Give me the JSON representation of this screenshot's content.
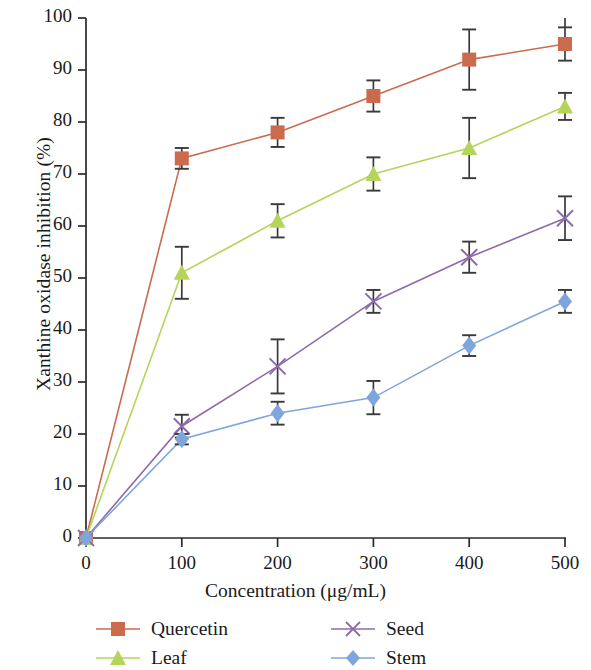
{
  "chart_data": {
    "type": "line",
    "title": "",
    "xlabel": "Concentration (μg/mL)",
    "ylabel": "Xanthine oxidase inhibition (%)",
    "x": [
      0,
      100,
      200,
      300,
      400,
      500
    ],
    "xlim": [
      0,
      500
    ],
    "ylim": [
      0,
      100
    ],
    "xticks": [
      "0",
      "100",
      "200",
      "300",
      "400",
      "500"
    ],
    "yticks": [
      "0",
      "10",
      "20",
      "30",
      "40",
      "50",
      "60",
      "70",
      "80",
      "90",
      "100"
    ],
    "grid": false,
    "legend_position": "below",
    "errorbars": true,
    "series": [
      {
        "name": "Quercetin",
        "color": "#cc6a4e",
        "marker": "square",
        "values": [
          0,
          73,
          78,
          85,
          92,
          95
        ],
        "errors": [
          0,
          2.0,
          2.8,
          3.0,
          5.8,
          3.2
        ]
      },
      {
        "name": "Leaf",
        "color": "#b4d45a",
        "marker": "triangle",
        "values": [
          0,
          51,
          61,
          70,
          75,
          83
        ],
        "errors": [
          0,
          5.0,
          3.2,
          3.2,
          5.8,
          2.6
        ]
      },
      {
        "name": "Seed",
        "color": "#8c6bab",
        "marker": "cross",
        "values": [
          0,
          21.5,
          33,
          45.5,
          54,
          61.5
        ],
        "errors": [
          0,
          2.2,
          5.2,
          2.2,
          3.0,
          4.2
        ]
      },
      {
        "name": "Stem",
        "color": "#7ea6dd",
        "marker": "diamond",
        "values": [
          0,
          19,
          24,
          27,
          37,
          45.5
        ],
        "errors": [
          0,
          1.0,
          2.2,
          3.2,
          2.0,
          2.2
        ]
      }
    ]
  },
  "legend": {
    "entries": [
      {
        "label": "Quercetin"
      },
      {
        "label": "Seed"
      },
      {
        "label": "Leaf"
      },
      {
        "label": "Stem"
      }
    ]
  }
}
